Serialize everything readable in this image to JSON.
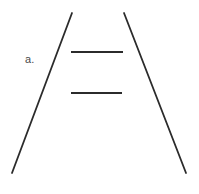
{
  "figure": {
    "label": "a.",
    "caption_label": "a.",
    "background_color": "#ffffff",
    "stroke_color": "#2b2b2b",
    "label_color": "#4a4a4a",
    "width": 199,
    "height": 194,
    "elements": {
      "left_converging_line": {
        "name": "left-converging-line",
        "x1": 72,
        "y1": 13,
        "x2": 12,
        "y2": 173,
        "stroke_width": 1.8
      },
      "right_converging_line": {
        "name": "right-converging-line",
        "x1": 124,
        "y1": 13,
        "x2": 186,
        "y2": 173,
        "stroke_width": 1.8
      },
      "upper_horizontal_bar": {
        "name": "upper-horizontal-bar",
        "x1": 71,
        "y1": 52,
        "x2": 123,
        "y2": 52,
        "stroke_width": 2.2,
        "length": 52
      },
      "lower_horizontal_bar": {
        "name": "lower-horizontal-bar",
        "x1": 71,
        "y1": 93,
        "x2": 122,
        "y2": 93,
        "stroke_width": 2.2,
        "length": 51
      }
    }
  }
}
